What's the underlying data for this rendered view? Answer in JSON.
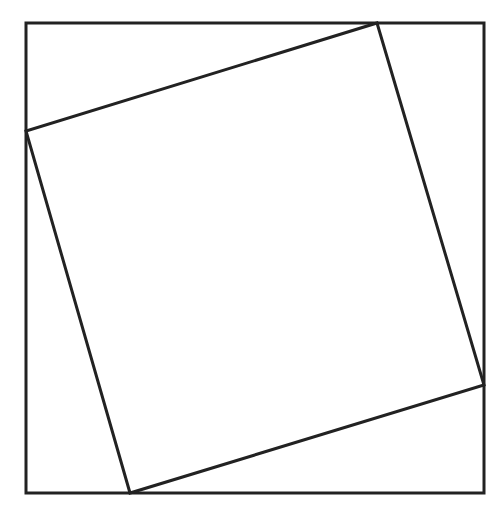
{
  "diagram": {
    "canvas": {
      "width": 504,
      "height": 513,
      "background": "#ffffff"
    },
    "stroke_color": "#222222",
    "stroke_width": 3,
    "outer_square": {
      "x": 26,
      "y": 23,
      "width": 458,
      "height": 470
    },
    "inner_square": {
      "points": [
        [
          377,
          23
        ],
        [
          484,
          385
        ],
        [
          130,
          493
        ],
        [
          26,
          131
        ]
      ]
    }
  }
}
